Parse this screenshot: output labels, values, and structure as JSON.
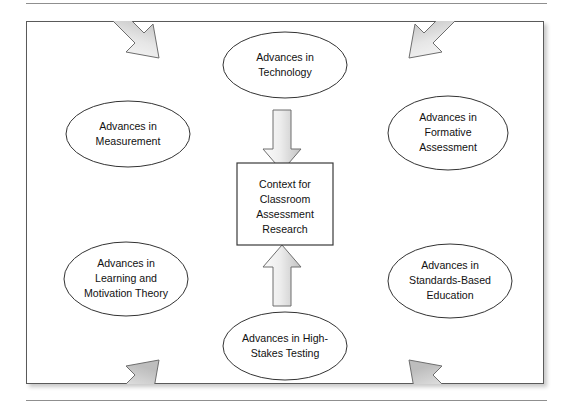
{
  "figure": {
    "title": "Context for Classroom Assessment Research",
    "type": "hub-and-spoke concept diagram",
    "center": {
      "shape": "rectangle",
      "lines": [
        "Context for",
        "Classroom",
        "Assessment",
        "Research"
      ]
    },
    "nodes": [
      {
        "id": "technology",
        "shape": "ellipse",
        "position": "top",
        "lines": [
          "Advances in",
          "Technology"
        ]
      },
      {
        "id": "measurement",
        "shape": "ellipse",
        "position": "upper-left",
        "lines": [
          "Advances in",
          "Measurement"
        ]
      },
      {
        "id": "formative-assessment",
        "shape": "ellipse",
        "position": "upper-right",
        "lines": [
          "Advances in",
          "Formative",
          "Assessment"
        ]
      },
      {
        "id": "learning-motivation-theory",
        "shape": "ellipse",
        "position": "lower-left",
        "lines": [
          "Advances in",
          "Learning and",
          "Motivation Theory"
        ]
      },
      {
        "id": "standards-based-education",
        "shape": "ellipse",
        "position": "lower-right",
        "lines": [
          "Advances in",
          "Standards-Based",
          "Education"
        ]
      },
      {
        "id": "high-stakes-testing",
        "shape": "ellipse",
        "position": "bottom",
        "lines": [
          "Advances in High-",
          "Stakes Testing"
        ]
      }
    ],
    "arrows": [
      {
        "id": "technology-to-center",
        "from": "technology",
        "to": "center",
        "direction": "down"
      },
      {
        "id": "measurement-to-center",
        "from": "measurement",
        "to": "center",
        "direction": "down-right"
      },
      {
        "id": "formative-assessment-to-center",
        "from": "formative-assessment",
        "to": "center",
        "direction": "down-left"
      },
      {
        "id": "learning-motivation-theory-to-center",
        "from": "learning-motivation-theory",
        "to": "center",
        "direction": "up-right"
      },
      {
        "id": "standards-based-education-to-center",
        "from": "standards-based-education",
        "to": "center",
        "direction": "up-left"
      },
      {
        "id": "high-stakes-testing-to-center",
        "from": "high-stakes-testing",
        "to": "center",
        "direction": "up"
      }
    ],
    "colors": {
      "page_background": "#ffffff",
      "frame_border": "#5a5a5a",
      "rule": "#8f8f8f",
      "node_stroke": "#333333",
      "node_fill": "#ffffff",
      "arrow_fill_light": "#f2f2f2",
      "arrow_fill_dark": "#c9c9c9",
      "arrow_stroke": "#6e6e6e",
      "text": "#111111"
    }
  }
}
